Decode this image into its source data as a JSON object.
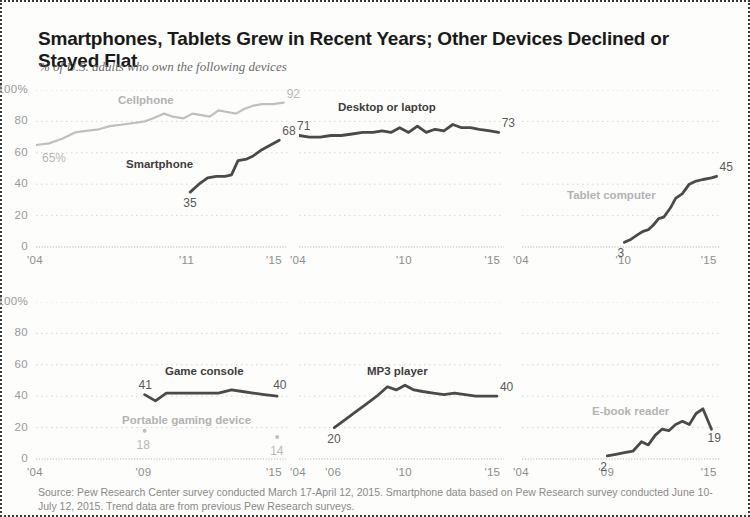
{
  "header": {
    "title": "Smartphones, Tablets Grew in Recent Years; Other Devices Declined or Stayed Flat",
    "subtitle": "% of U.S. adults who own the following devices"
  },
  "source": {
    "text": "Source: Pew Research Center survey conducted March 17-April 12, 2015. Smartphone data based on Pew Research survey conducted June 10-July 12, 2015. Trend data are from previous Pew Research surveys."
  },
  "colors": {
    "dark_line": "#4a4a4a",
    "light_line": "#bfbfbf",
    "gridline": "#d8d8d8",
    "axis_text": "#8d8d8d",
    "title_text": "#1a1a1a",
    "subtitle_text": "#6d6d6d",
    "frame": "#3a3a3a"
  },
  "chart_data": [
    {
      "type": "line",
      "title": "Cellphone and Smartphone",
      "panel": 1,
      "xlabel": "",
      "ylabel": "",
      "ylim": [
        0,
        100
      ],
      "xlim": [
        2004,
        2015.6
      ],
      "yticks": [
        0,
        20,
        40,
        60,
        80,
        100
      ],
      "ytick_labels": [
        "0",
        "20",
        "40",
        "60",
        "80",
        "100%"
      ],
      "xticks": [
        2004,
        2011,
        2015
      ],
      "xtick_labels": [
        "'04",
        "'11",
        "'15"
      ],
      "grid": true,
      "legend": "inline-labels",
      "series": [
        {
          "name": "Cellphone",
          "style": "light",
          "label_text": "Cellphone",
          "start_label": "65%",
          "end_label": "92",
          "x": [
            2004.0,
            2004.6,
            2005.2,
            2005.8,
            2006.3,
            2006.9,
            2007.4,
            2008.0,
            2008.5,
            2009.0,
            2009.4,
            2009.9,
            2010.3,
            2010.8,
            2011.2,
            2011.6,
            2012.0,
            2012.4,
            2012.8,
            2013.2,
            2013.6,
            2014.0,
            2014.4,
            2014.9,
            2015.4
          ],
          "values": [
            65,
            66,
            69,
            73,
            74,
            75,
            77,
            78,
            79,
            80,
            82,
            85,
            83,
            82,
            85,
            84,
            83,
            87,
            86,
            85,
            88,
            90,
            91,
            91,
            92
          ]
        },
        {
          "name": "Smartphone",
          "style": "dark",
          "label_text": "Smartphone",
          "start_label": "35",
          "end_label": "68",
          "x": [
            2011.1,
            2011.5,
            2011.9,
            2012.3,
            2012.7,
            2013.0,
            2013.3,
            2013.7,
            2014.0,
            2014.4,
            2014.8,
            2015.2
          ],
          "values": [
            35,
            40,
            44,
            45,
            45,
            46,
            55,
            56,
            58,
            62,
            65,
            68
          ]
        }
      ]
    },
    {
      "type": "line",
      "title": "Desktop or laptop",
      "panel": 2,
      "ylim": [
        0,
        100
      ],
      "xlim": [
        2004,
        2015.6
      ],
      "yticks": [
        0,
        20,
        40,
        60,
        80,
        100
      ],
      "ytick_labels": [
        "0",
        "20",
        "40",
        "60",
        "80",
        "100%"
      ],
      "xticks": [
        2004,
        2010,
        2015
      ],
      "xtick_labels": [
        "'04",
        "'10",
        "'15"
      ],
      "grid": true,
      "series": [
        {
          "name": "Desktop or laptop",
          "style": "dark",
          "label_text": "Desktop or laptop",
          "start_label": "71",
          "end_label": "73",
          "x": [
            2004.0,
            2004.6,
            2005.2,
            2005.8,
            2006.4,
            2007.0,
            2007.6,
            2008.2,
            2008.7,
            2009.2,
            2009.7,
            2010.2,
            2010.7,
            2011.2,
            2011.7,
            2012.2,
            2012.7,
            2013.2,
            2013.7,
            2014.2,
            2014.8,
            2015.3
          ],
          "values": [
            71,
            70,
            70,
            71,
            71,
            72,
            73,
            73,
            74,
            73,
            76,
            73,
            77,
            73,
            75,
            74,
            78,
            76,
            76,
            75,
            74,
            73
          ]
        }
      ]
    },
    {
      "type": "line",
      "title": "Tablet computer",
      "panel": 3,
      "ylim": [
        0,
        100
      ],
      "xlim": [
        2004,
        2015.6
      ],
      "yticks": [
        0,
        20,
        40,
        60,
        80,
        100
      ],
      "ytick_labels": [
        "0",
        "20",
        "40",
        "60",
        "80",
        "100%"
      ],
      "xticks": [
        2004,
        2010,
        2015
      ],
      "xtick_labels": [
        "'04",
        "'10",
        "'15"
      ],
      "grid": true,
      "series": [
        {
          "name": "Tablet computer",
          "style": "dark",
          "label_text": "Tablet computer",
          "start_label": "3",
          "end_label": "45",
          "x": [
            2010.0,
            2010.4,
            2010.8,
            2011.1,
            2011.4,
            2011.7,
            2012.0,
            2012.3,
            2012.7,
            2013.0,
            2013.4,
            2013.8,
            2014.2,
            2014.6,
            2015.1,
            2015.4
          ],
          "values": [
            3,
            5,
            8,
            10,
            11,
            14,
            18,
            19,
            25,
            31,
            34,
            40,
            42,
            43,
            44,
            45
          ]
        }
      ]
    },
    {
      "type": "line",
      "title": "Game console and Portable gaming device",
      "panel": 4,
      "ylim": [
        0,
        100
      ],
      "xlim": [
        2004,
        2015.6
      ],
      "yticks": [
        0,
        20,
        40,
        60,
        80,
        100
      ],
      "ytick_labels": [
        "0",
        "20",
        "40",
        "60",
        "80",
        "100%"
      ],
      "xticks": [
        2004,
        2009,
        2015
      ],
      "xtick_labels": [
        "'04",
        "'09",
        "'15"
      ],
      "grid": true,
      "series": [
        {
          "name": "Game console",
          "style": "dark",
          "label_text": "Game console",
          "start_label": "41",
          "end_label": "40",
          "x": [
            2009.0,
            2009.5,
            2010.0,
            2010.6,
            2011.2,
            2011.8,
            2012.4,
            2013.0,
            2013.5,
            2014.0,
            2014.5,
            2015.1
          ],
          "values": [
            41,
            37,
            42,
            42,
            42,
            42,
            42,
            44,
            43,
            42,
            41,
            40
          ]
        },
        {
          "name": "Portable gaming device",
          "style": "light",
          "label_text": "Portable gaming device",
          "marker_only": true,
          "start_label": "18",
          "end_label": "14",
          "x": [
            2009.0,
            2015.1
          ],
          "values": [
            18,
            14
          ]
        }
      ]
    },
    {
      "type": "line",
      "title": "MP3 player",
      "panel": 5,
      "ylim": [
        0,
        100
      ],
      "xlim": [
        2004,
        2015.6
      ],
      "yticks": [
        0,
        20,
        40,
        60,
        80,
        100
      ],
      "ytick_labels": [
        "0",
        "20",
        "40",
        "60",
        "80",
        "100%"
      ],
      "xticks": [
        2004,
        2006,
        2010,
        2015
      ],
      "xtick_labels": [
        "'04",
        "'06",
        "'10",
        "'15"
      ],
      "grid": true,
      "series": [
        {
          "name": "MP3 player",
          "style": "dark",
          "label_text": "MP3 player",
          "start_label": "20",
          "end_label": "40",
          "x": [
            2006.0,
            2006.6,
            2007.2,
            2007.8,
            2008.4,
            2009.0,
            2009.5,
            2010.0,
            2010.5,
            2011.0,
            2011.6,
            2012.2,
            2012.8,
            2013.4,
            2014.0,
            2014.6,
            2015.2
          ],
          "values": [
            20,
            25,
            30,
            35,
            40,
            46,
            44,
            47,
            44,
            43,
            42,
            41,
            42,
            41,
            40,
            40,
            40
          ]
        }
      ]
    },
    {
      "type": "line",
      "title": "E-book reader",
      "panel": 6,
      "ylim": [
        0,
        100
      ],
      "xlim": [
        2004,
        2015.6
      ],
      "yticks": [
        0,
        20,
        40,
        60,
        80,
        100
      ],
      "ytick_labels": [
        "0",
        "20",
        "40",
        "60",
        "80",
        "100%"
      ],
      "xticks": [
        2004,
        2009,
        2015
      ],
      "xtick_labels": [
        "'04",
        "'09",
        "'15"
      ],
      "grid": true,
      "series": [
        {
          "name": "E-book reader",
          "style": "dark",
          "label_text": "E-book reader",
          "start_label": "2",
          "end_label": "19",
          "x": [
            2009.0,
            2009.5,
            2010.0,
            2010.5,
            2011.0,
            2011.4,
            2011.8,
            2012.2,
            2012.6,
            2013.0,
            2013.4,
            2013.8,
            2014.2,
            2014.6,
            2015.1
          ],
          "values": [
            2,
            3,
            4,
            5,
            11,
            9,
            15,
            19,
            18,
            22,
            24,
            22,
            29,
            32,
            19
          ]
        }
      ]
    }
  ],
  "panel_layout": [
    {
      "id": 1,
      "left": 34,
      "top": 88,
      "width": 252,
      "height": 157,
      "xtick_y": 252
    },
    {
      "id": 2,
      "left": 297,
      "top": 88,
      "width": 205,
      "height": 157,
      "xtick_y": 252
    },
    {
      "id": 3,
      "left": 520,
      "top": 88,
      "width": 198,
      "height": 157,
      "xtick_y": 252
    },
    {
      "id": 4,
      "left": 34,
      "top": 300,
      "width": 252,
      "height": 157,
      "xtick_y": 464
    },
    {
      "id": 5,
      "left": 297,
      "top": 300,
      "width": 205,
      "height": 157,
      "xtick_y": 464
    },
    {
      "id": 6,
      "left": 520,
      "top": 300,
      "width": 198,
      "height": 157,
      "xtick_y": 464
    }
  ],
  "annotations": {
    "panel1_cellphone_label": {
      "x": 116,
      "y": 92
    },
    "panel1_smartphone_label": {
      "x": 124,
      "y": 156
    },
    "panel2_label": {
      "x": 336,
      "y": 99
    },
    "panel3_label": {
      "x": 565,
      "y": 187
    },
    "panel4_gameconsole_label": {
      "x": 163,
      "y": 363
    },
    "panel4_portable_label": {
      "x": 120,
      "y": 412
    },
    "panel5_label": {
      "x": 365,
      "y": 363
    },
    "panel6_label": {
      "x": 590,
      "y": 403
    }
  }
}
